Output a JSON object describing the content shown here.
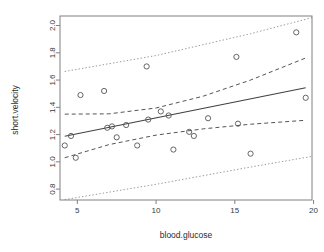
{
  "figure": {
    "kind": "r-base-scatterplot",
    "background": "#ffffff",
    "box_color": "#808080",
    "point_color": "#555555",
    "fit_color": "#404040",
    "confidence_color": "#555555",
    "prediction_color": "#9a9a9a"
  },
  "chart_data": {
    "type": "scatter",
    "title": "",
    "xlabel": "blood.glucose",
    "ylabel": "short.velocity",
    "xlim": [
      3.9,
      19.9
    ],
    "ylim": [
      0.72,
      2.07
    ],
    "grid": false,
    "legend": null,
    "xticks": [
      5,
      10,
      15,
      20
    ],
    "xticklabels": [
      "5",
      "10",
      "15",
      "20"
    ],
    "yticks": [
      0.8,
      1.0,
      1.2,
      1.4,
      1.6,
      1.8,
      2.0
    ],
    "yticklabels": [
      "0.8",
      "1.0",
      "1.2",
      "1.4",
      "1.6",
      "1.8",
      "2.0"
    ],
    "points": [
      {
        "x": 4.2,
        "y": 1.12
      },
      {
        "x": 4.6,
        "y": 1.19
      },
      {
        "x": 4.9,
        "y": 1.03
      },
      {
        "x": 5.2,
        "y": 1.49
      },
      {
        "x": 6.7,
        "y": 1.52
      },
      {
        "x": 6.9,
        "y": 1.25
      },
      {
        "x": 7.2,
        "y": 1.26
      },
      {
        "x": 7.5,
        "y": 1.18
      },
      {
        "x": 8.1,
        "y": 1.27
      },
      {
        "x": 8.8,
        "y": 1.12
      },
      {
        "x": 9.4,
        "y": 1.7
      },
      {
        "x": 9.5,
        "y": 1.31
      },
      {
        "x": 10.3,
        "y": 1.37
      },
      {
        "x": 10.8,
        "y": 1.34
      },
      {
        "x": 11.1,
        "y": 1.09
      },
      {
        "x": 12.1,
        "y": 1.22
      },
      {
        "x": 12.4,
        "y": 1.19
      },
      {
        "x": 13.3,
        "y": 1.32
      },
      {
        "x": 15.1,
        "y": 1.77
      },
      {
        "x": 15.2,
        "y": 1.28
      },
      {
        "x": 16.0,
        "y": 1.06
      },
      {
        "x": 18.9,
        "y": 1.95
      },
      {
        "x": 19.5,
        "y": 1.47
      }
    ],
    "series": [
      {
        "name": "fit",
        "style": "solid",
        "x": [
          4.2,
          19.5
        ],
        "values": [
          1.188,
          1.543
        ]
      },
      {
        "name": "confidence-upper",
        "style": "dashed",
        "x": [
          4.2,
          7.0,
          10.0,
          13.0,
          16.0,
          19.5
        ],
        "values": [
          1.35,
          1.352,
          1.395,
          1.482,
          1.6,
          1.762
        ]
      },
      {
        "name": "confidence-lower",
        "style": "dashed",
        "x": [
          4.2,
          7.0,
          10.0,
          13.0,
          16.0,
          19.5
        ],
        "values": [
          1.03,
          1.126,
          1.196,
          1.242,
          1.276,
          1.305
        ]
      },
      {
        "name": "prediction-upper",
        "style": "dotted",
        "x": [
          4.2,
          10.0,
          16.0,
          19.9
        ],
        "values": [
          1.663,
          1.78,
          1.94,
          2.058
        ]
      },
      {
        "name": "prediction-lower",
        "style": "dotted",
        "x": [
          4.2,
          10.0,
          16.0,
          19.9
        ],
        "values": [
          0.723,
          0.835,
          0.962,
          1.04
        ]
      }
    ]
  }
}
